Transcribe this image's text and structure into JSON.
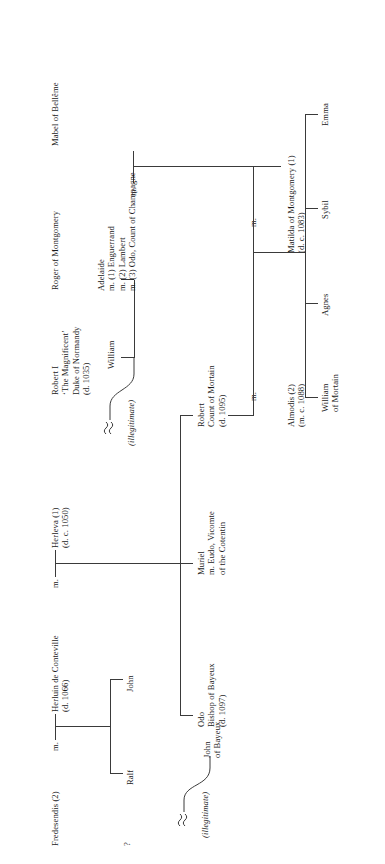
{
  "diagram": {
    "type": "family-tree",
    "orientation": "rotated-90-ccw",
    "line_color": "#3a3a3a",
    "background": "#ffffff"
  },
  "people": {
    "unknown_partner": "?",
    "fredesendis": "Fredesendis (2)",
    "herluin": "Herluin de Conteville\n(d. 1066)",
    "herleva": "Herleva (1)\n(d. c. 1050)",
    "robert_i": "Robert I\n‘The Magnificent’\nDuke of Normandy\n(d. 1035)",
    "roger_montgomery": "Roger of Montgomery",
    "mabel_belleme": "Mabel of Bellême",
    "john_of_bayeux": "John\nof Bayeux",
    "ralf": "Ralf",
    "john": "John",
    "odo": "Odo\nBishop of Bayeux\n(d. 1097)",
    "muriel": "Muriel\nm. Eudo, Vicomte\nof the Cotentin",
    "robert_mortain": "Robert\nCount of Mortain\n(d. 1095)",
    "william": "William",
    "adelaide": "Adelaide\nm. (1) Enguerrand\nm. (2) Lambert\nm. (3) Odo, Count of Champagne",
    "matilda_montgomery": "Matilda of Montgomery (1)\n(d. c. 1083)",
    "almodis": "Almodis (2)\n(m. c. 1088)",
    "william_of_mortain": "William\nof Mortain",
    "agnes": "Agnes",
    "sybil": "Sybil",
    "emma": "Emma"
  },
  "marriages": {
    "m1_label": "m.",
    "m2_label": "m.",
    "m3_label": "m.",
    "m4_label": "m.",
    "m5_label": "m."
  },
  "annotations": {
    "illegitimate_1": "(illegitimate)",
    "illegitimate_2": "(illegitimate)"
  }
}
